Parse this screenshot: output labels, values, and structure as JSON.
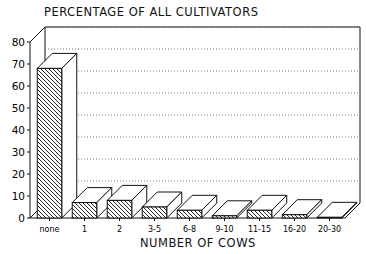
{
  "chart_data": {
    "type": "bar",
    "title": "PERCENTAGE OF ALL CULTIVATORS",
    "xlabel": "NUMBER OF COWS",
    "ylabel": "",
    "categories": [
      "none",
      "1",
      "2",
      "3-5",
      "6-8",
      "9-10",
      "11-15",
      "16-20",
      "20-30"
    ],
    "values": [
      68,
      7,
      8,
      5,
      3.5,
      1,
      3.5,
      1.5,
      0.3
    ],
    "ylim": [
      0,
      80
    ],
    "yticks": [
      0,
      10,
      20,
      30,
      40,
      50,
      60,
      70,
      80
    ],
    "grid": true,
    "style": "3d hatched bars"
  }
}
